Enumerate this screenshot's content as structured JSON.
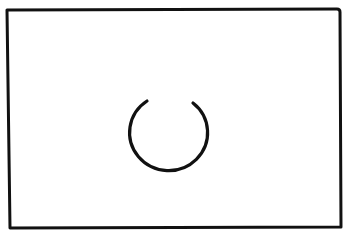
{
  "canvas": {
    "width": 347,
    "height": 231,
    "background": "#ffffff"
  },
  "frame": {
    "label": "container-box",
    "stroke": "#111111"
  },
  "spinner": {
    "icon": "loading-spinner-icon",
    "stroke": "#111111",
    "gap": "top"
  }
}
